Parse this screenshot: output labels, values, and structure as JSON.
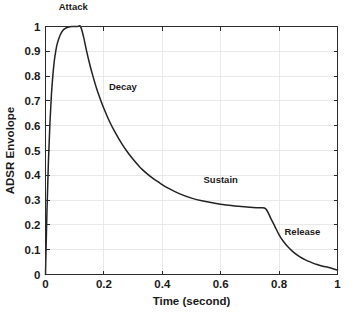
{
  "figure": {
    "background_color": "#ffffff",
    "curve_color": "#222222",
    "grid_color": "#e3e3e3",
    "axis_color": "#2b2b2b"
  },
  "chart_data": {
    "type": "line",
    "title": "",
    "xlabel": "Time (second)",
    "ylabel": "ADSR Envolope",
    "xlim": [
      0,
      1
    ],
    "ylim": [
      0,
      1
    ],
    "xticks": [
      0,
      0.2,
      0.4,
      0.6,
      0.8,
      1
    ],
    "xticklabels": [
      "0",
      "0.2",
      "0.4",
      "0.6",
      "0.8",
      "1"
    ],
    "yticks": [
      0,
      0.1,
      0.2,
      0.3,
      0.4,
      0.5,
      0.6,
      0.7,
      0.8,
      0.9,
      1
    ],
    "yticklabels": [
      "0",
      "0.1",
      "0.2",
      "0.3",
      "0.4",
      "0.5",
      "0.6",
      "0.7",
      "0.8",
      "0.9",
      "1"
    ],
    "grid": true,
    "legend": "none",
    "series": [
      {
        "name": "ADSR Envelope",
        "x": [
          0.0,
          0.005,
          0.01,
          0.015,
          0.02,
          0.025,
          0.03,
          0.035,
          0.04,
          0.05,
          0.06,
          0.07,
          0.08,
          0.09,
          0.1,
          0.11,
          0.12,
          0.13,
          0.14,
          0.15,
          0.16,
          0.175,
          0.19,
          0.205,
          0.22,
          0.24,
          0.26,
          0.28,
          0.3,
          0.33,
          0.36,
          0.39,
          0.42,
          0.46,
          0.5,
          0.54,
          0.58,
          0.62,
          0.66,
          0.7,
          0.73,
          0.75,
          0.76,
          0.772,
          0.785,
          0.8,
          0.815,
          0.83,
          0.85,
          0.87,
          0.89,
          0.91,
          0.93,
          0.95,
          0.97,
          1.0
        ],
        "y": [
          0.0,
          0.255,
          0.455,
          0.605,
          0.72,
          0.8,
          0.86,
          0.9,
          0.93,
          0.965,
          0.985,
          0.994,
          0.998,
          1.0,
          1.0,
          1.0,
          1.0,
          0.96,
          0.905,
          0.855,
          0.81,
          0.75,
          0.7,
          0.655,
          0.615,
          0.57,
          0.53,
          0.495,
          0.465,
          0.425,
          0.395,
          0.37,
          0.348,
          0.325,
          0.308,
          0.296,
          0.287,
          0.28,
          0.275,
          0.271,
          0.269,
          0.268,
          0.255,
          0.225,
          0.195,
          0.16,
          0.133,
          0.112,
          0.089,
          0.072,
          0.059,
          0.049,
          0.04,
          0.033,
          0.028,
          0.018
        ]
      }
    ],
    "annotations": [
      {
        "text": "Attack",
        "x": 0.095,
        "y": 1.065
      },
      {
        "text": "Decay",
        "x": 0.265,
        "y": 0.745
      },
      {
        "text": "Sustain",
        "x": 0.6,
        "y": 0.37
      },
      {
        "text": "Release",
        "x": 0.88,
        "y": 0.16
      }
    ]
  }
}
